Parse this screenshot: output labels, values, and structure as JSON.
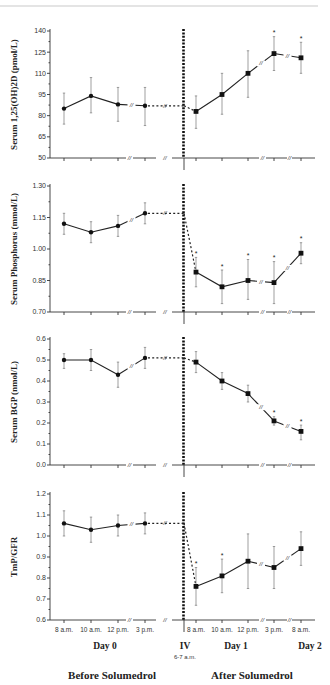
{
  "page_header": {
    "text": ""
  },
  "chart_data": [
    {
      "type": "line",
      "ylabel": "Serum 1,25(OH)2D (pmol/L)",
      "ylim": [
        50,
        140
      ],
      "yticks": [
        50,
        65,
        80,
        95,
        110,
        125,
        140
      ],
      "ytick_labels": [
        "50",
        "65",
        "80",
        "95",
        "110",
        "125",
        "140"
      ],
      "before": {
        "values": [
          85,
          94,
          88,
          87
        ],
        "err_low": [
          74,
          82,
          76,
          73
        ],
        "err_high": [
          96,
          107,
          100,
          100
        ],
        "sig": [
          false,
          false,
          false,
          false
        ]
      },
      "after": {
        "values": [
          83,
          95,
          110,
          124,
          121
        ],
        "err_low": [
          71,
          81,
          93,
          112,
          110
        ],
        "err_high": [
          94,
          110,
          126,
          136,
          132
        ],
        "sig": [
          false,
          false,
          false,
          true,
          true
        ]
      }
    },
    {
      "type": "line",
      "ylabel": "Serum Phosphorus (mmol/L)",
      "ylim": [
        0.7,
        1.3
      ],
      "yticks": [
        0.7,
        0.85,
        1.0,
        1.15,
        1.3
      ],
      "ytick_labels": [
        "0.70",
        "0.85",
        "1.00",
        "1.15",
        "1.30"
      ],
      "before": {
        "values": [
          1.12,
          1.08,
          1.11,
          1.17
        ],
        "err_low": [
          1.07,
          1.03,
          1.06,
          1.12
        ],
        "err_high": [
          1.17,
          1.13,
          1.16,
          1.22
        ],
        "sig": [
          false,
          false,
          false,
          false
        ]
      },
      "after": {
        "values": [
          0.89,
          0.82,
          0.85,
          0.84,
          0.98
        ],
        "err_low": [
          0.82,
          0.74,
          0.76,
          0.74,
          0.93
        ],
        "err_high": [
          0.96,
          0.9,
          0.95,
          0.94,
          1.03
        ],
        "sig": [
          true,
          true,
          true,
          true,
          true
        ]
      }
    },
    {
      "type": "line",
      "ylabel": "Serum BGP (nmol/L)",
      "ylim": [
        0.0,
        0.6
      ],
      "yticks": [
        0.0,
        0.1,
        0.2,
        0.3,
        0.4,
        0.5,
        0.6
      ],
      "ytick_labels": [
        "0.0",
        "0.1",
        "0.2",
        "0.3",
        "0.4",
        "0.5",
        "0.6"
      ],
      "before": {
        "values": [
          0.5,
          0.5,
          0.43,
          0.51
        ],
        "err_low": [
          0.46,
          0.45,
          0.37,
          0.46
        ],
        "err_high": [
          0.53,
          0.55,
          0.49,
          0.56
        ],
        "sig": [
          false,
          false,
          false,
          false
        ]
      },
      "after": {
        "values": [
          0.49,
          0.4,
          0.34,
          0.21,
          0.16
        ],
        "err_low": [
          0.44,
          0.36,
          0.3,
          0.19,
          0.12
        ],
        "err_high": [
          0.54,
          0.44,
          0.38,
          0.23,
          0.19
        ],
        "sig": [
          false,
          false,
          false,
          true,
          true
        ]
      }
    },
    {
      "type": "line",
      "ylabel": "TmP/GFR",
      "ylim": [
        0.6,
        1.2
      ],
      "yticks": [
        0.6,
        0.7,
        0.8,
        0.9,
        1.0,
        1.1,
        1.2
      ],
      "ytick_labels": [
        "0.6",
        "0.7",
        "0.8",
        "0.9",
        "1.0",
        "1.1",
        "1.2"
      ],
      "before": {
        "values": [
          1.06,
          1.03,
          1.05,
          1.06
        ],
        "err_low": [
          1.0,
          0.97,
          1.0,
          1.01
        ],
        "err_high": [
          1.12,
          1.09,
          1.1,
          1.11
        ],
        "sig": [
          false,
          false,
          false,
          false
        ]
      },
      "after": {
        "values": [
          0.76,
          0.81,
          0.88,
          0.85,
          0.94
        ],
        "err_low": [
          0.67,
          0.73,
          0.75,
          0.75,
          0.86
        ],
        "err_high": [
          0.85,
          0.89,
          1.01,
          0.95,
          1.02
        ],
        "sig": [
          true,
          true,
          false,
          false,
          false
        ]
      }
    }
  ],
  "x_axis": {
    "before_ticks": [
      "8 a.m.",
      "10 a.m.",
      "12 p.m.",
      "3 p.m."
    ],
    "after_ticks": [
      "8 a.m.",
      "10 a.m.",
      "12 p.m.",
      "3 p.m.",
      "8 a.m."
    ],
    "day0_label": "Day 0",
    "day1_label": "Day 1",
    "day2_label": "Day 2",
    "iv_label": "IV",
    "iv_time": "6-7 a.m.",
    "break_mark": "//",
    "sig_mark": "*"
  },
  "phases": {
    "before": "Before Solumedrol",
    "after": "After Solumedrol"
  }
}
